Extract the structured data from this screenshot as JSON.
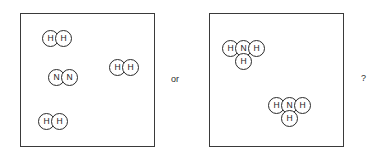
{
  "canvas": {
    "width": 381,
    "height": 156,
    "background": "#ffffff"
  },
  "style": {
    "atom_diameter": 17,
    "atom_stroke": "#2b2b2b",
    "atom_fill": "#ffffff",
    "box_stroke": "#3a3a3a",
    "text_color": "#1a1a1a"
  },
  "panels": [
    {
      "id": "left-panel",
      "name": "reactants-box",
      "x": 20,
      "y": 13,
      "width": 135,
      "height": 134,
      "molecules": [
        {
          "id": "h2-top-left",
          "formula": "H2",
          "atoms": [
            {
              "label": "H",
              "x": 21,
              "y": 16
            },
            {
              "label": "H",
              "x": 34,
              "y": 16
            }
          ]
        },
        {
          "id": "n2-middle-left",
          "formula": "N2",
          "atoms": [
            {
              "label": "N",
              "x": 27,
              "y": 55
            },
            {
              "label": "N",
              "x": 40,
              "y": 55
            }
          ]
        },
        {
          "id": "h2-middle-right",
          "formula": "H2",
          "atoms": [
            {
              "label": "H",
              "x": 88,
              "y": 45
            },
            {
              "label": "H",
              "x": 101,
              "y": 45
            }
          ]
        },
        {
          "id": "h2-bottom-left",
          "formula": "H2",
          "atoms": [
            {
              "label": "H",
              "x": 17,
              "y": 99
            },
            {
              "label": "H",
              "x": 30,
              "y": 99
            }
          ]
        }
      ]
    },
    {
      "id": "right-panel",
      "name": "products-box",
      "x": 209,
      "y": 13,
      "width": 135,
      "height": 134,
      "molecules": [
        {
          "id": "nh3-upper-left",
          "formula": "NH3",
          "atoms": [
            {
              "label": "H",
              "x": 12,
              "y": 26
            },
            {
              "label": "N",
              "x": 25,
              "y": 26
            },
            {
              "label": "H",
              "x": 38,
              "y": 26
            },
            {
              "label": "H",
              "x": 25,
              "y": 39
            }
          ]
        },
        {
          "id": "nh3-lower-right",
          "formula": "NH3",
          "atoms": [
            {
              "label": "H",
              "x": 58,
              "y": 83
            },
            {
              "label": "N",
              "x": 71,
              "y": 83
            },
            {
              "label": "H",
              "x": 84,
              "y": 83
            },
            {
              "label": "H",
              "x": 71,
              "y": 96
            }
          ]
        }
      ]
    }
  ],
  "connectors": [
    {
      "id": "or-label",
      "name": "or-separator-text",
      "text": "or",
      "x": 171,
      "y": 74
    },
    {
      "id": "question-label",
      "name": "question-mark-text",
      "text": "?",
      "x": 361,
      "y": 73
    }
  ]
}
